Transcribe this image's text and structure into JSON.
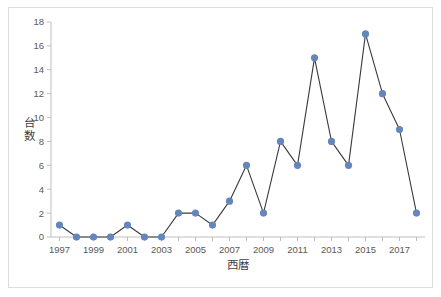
{
  "chart_data": {
    "type": "line",
    "title": "",
    "xlabel": "西暦",
    "ylabel": "台数",
    "x": [
      1997,
      1998,
      1999,
      2000,
      2001,
      2002,
      2003,
      2004,
      2005,
      2006,
      2007,
      2008,
      2009,
      2010,
      2011,
      2012,
      2013,
      2014,
      2015,
      2016,
      2017,
      2018
    ],
    "values": [
      1,
      0,
      0,
      0,
      1,
      0,
      0,
      2,
      2,
      1,
      3,
      6,
      2,
      8,
      6,
      15,
      8,
      6,
      17,
      12,
      9,
      2
    ],
    "series": [
      {
        "name": "台数",
        "values": [
          1,
          0,
          0,
          0,
          1,
          0,
          0,
          2,
          2,
          1,
          3,
          6,
          2,
          8,
          6,
          15,
          8,
          6,
          17,
          12,
          9,
          2
        ]
      }
    ],
    "x_tick_labels": [
      "1997",
      "1999",
      "2001",
      "2003",
      "2005",
      "2007",
      "2009",
      "2011",
      "2013",
      "2015",
      "2017"
    ],
    "x_tick_values": [
      1997,
      1999,
      2001,
      2003,
      2005,
      2007,
      2009,
      2011,
      2013,
      2015,
      2017
    ],
    "y_tick_labels": [
      "0",
      "2",
      "4",
      "6",
      "8",
      "10",
      "12",
      "14",
      "16",
      "18"
    ],
    "y_tick_values": [
      0,
      2,
      4,
      6,
      8,
      10,
      12,
      14,
      16,
      18
    ],
    "xlim": [
      1996.5,
      2018.5
    ],
    "ylim": [
      0,
      18
    ],
    "grid": false,
    "legend": false,
    "legend_position": "none",
    "marker_color": "#6486BC",
    "line_color": "#3A3A3A",
    "axis_color": "#BFBFBF",
    "tick_label_color": "#595959",
    "axis_title_color": "#404040",
    "frame_border_color": "#DCDCDC",
    "background_color": "#FFFFFF"
  }
}
